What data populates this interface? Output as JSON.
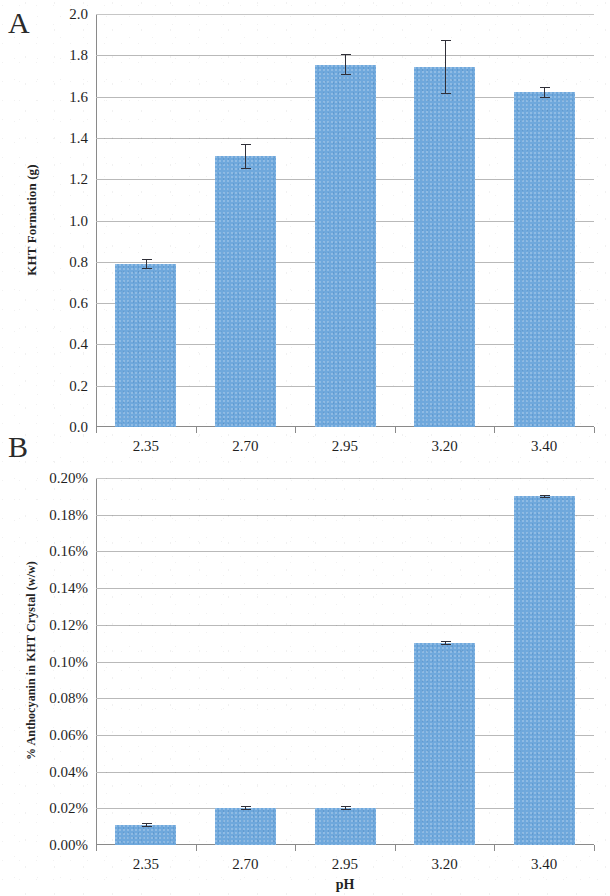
{
  "figure": {
    "panel_a_letter": "A",
    "panel_b_letter": "B"
  },
  "chart_data": [
    {
      "panel": "A",
      "type": "bar",
      "title": "",
      "xlabel": "",
      "ylabel": "KHT Formation (g)",
      "categories": [
        "2.35",
        "2.70",
        "2.95",
        "3.20",
        "3.40"
      ],
      "values": [
        0.79,
        1.31,
        1.755,
        1.745,
        1.62
      ],
      "errors": [
        0.025,
        0.06,
        0.05,
        0.13,
        0.025
      ],
      "ylim": [
        0.0,
        2.0
      ],
      "ytick_values": [
        0.0,
        0.2,
        0.4,
        0.6,
        0.8,
        1.0,
        1.2,
        1.4,
        1.6,
        1.8,
        2.0
      ],
      "ytick_labels": [
        "0.0",
        "0.2",
        "0.4",
        "0.6",
        "0.8",
        "1.0",
        "1.2",
        "1.4",
        "1.6",
        "1.8",
        "2.0"
      ],
      "grid": true,
      "legend": "none",
      "bar_color": "#6fa8dc",
      "errorbar_color": "#2f2f38"
    },
    {
      "panel": "B",
      "type": "bar",
      "title": "",
      "xlabel": "pH",
      "ylabel": "% Anthocyanin in KHT Crystal (w/w)",
      "categories": [
        "2.35",
        "2.70",
        "2.95",
        "3.20",
        "3.40"
      ],
      "values": [
        0.011,
        0.02,
        0.02,
        0.11,
        0.19
      ],
      "errors": [
        0.001,
        0.001,
        0.001,
        0.001,
        0.001
      ],
      "ylim": [
        0.0,
        0.2
      ],
      "ytick_values": [
        0.0,
        0.02,
        0.04,
        0.06,
        0.08,
        0.1,
        0.12,
        0.14,
        0.16,
        0.18,
        0.2
      ],
      "ytick_labels": [
        "0.00%",
        "0.02%",
        "0.04%",
        "0.06%",
        "0.08%",
        "0.10%",
        "0.12%",
        "0.14%",
        "0.16%",
        "0.18%",
        "0.20%"
      ],
      "grid": true,
      "legend": "none",
      "bar_color": "#6fa8dc",
      "errorbar_color": "#2f2f38"
    }
  ]
}
